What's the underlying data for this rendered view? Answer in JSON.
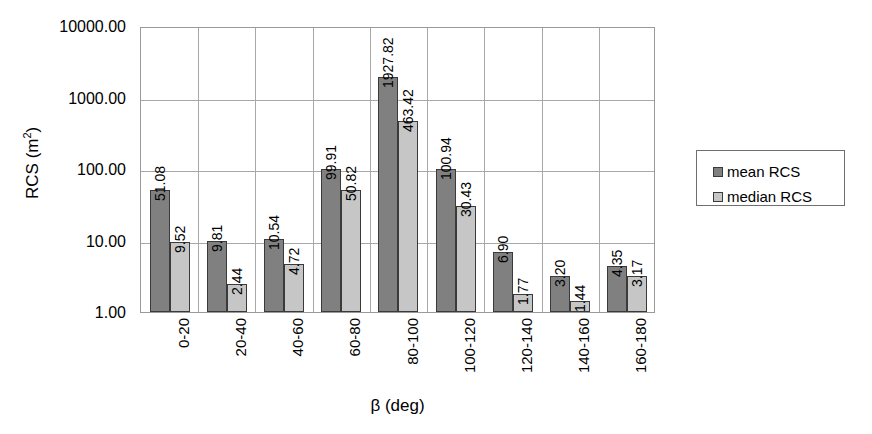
{
  "chart_data": {
    "type": "bar",
    "title": "",
    "xlabel": "β (deg)",
    "ylabel": "RCS (m²)",
    "ylabel_text": "RCS (m",
    "ylabel_sup": "2",
    "ylabel_tail": ")",
    "yscale": "log",
    "ylim": [
      1.0,
      10000.0
    ],
    "grid": "both",
    "legend_position": "right",
    "ytick_labels": [
      "10000.00",
      "1000.00",
      "100.00",
      "10.00",
      "1.00"
    ],
    "ytick_values": [
      10000,
      1000,
      100,
      10,
      1
    ],
    "categories": [
      "0-20",
      "20-40",
      "40-60",
      "60-80",
      "80-100",
      "100-120",
      "120-140",
      "140-160",
      "160-180"
    ],
    "series": [
      {
        "name": "mean RCS",
        "color": "#808080",
        "values": [
          51.08,
          9.81,
          10.54,
          99.91,
          1927.82,
          100.94,
          6.9,
          3.2,
          4.35
        ],
        "labels": [
          "51.08",
          "9.81",
          "10.54",
          "99.91",
          "1927.82",
          "100.94",
          "6.90",
          "3.20",
          "4.35"
        ]
      },
      {
        "name": "median RCS",
        "color": "#c6c6c6",
        "values": [
          9.52,
          2.44,
          4.72,
          50.82,
          463.42,
          30.43,
          1.77,
          1.44,
          3.17
        ],
        "labels": [
          "9.52",
          "2.44",
          "4.72",
          "50.82",
          "463.42",
          "30.43",
          "1.77",
          "1.44",
          "3.17"
        ]
      }
    ]
  },
  "legend": {
    "items": [
      {
        "label": "mean RCS",
        "color": "#808080"
      },
      {
        "label": "median RCS",
        "color": "#c6c6c6"
      }
    ]
  }
}
